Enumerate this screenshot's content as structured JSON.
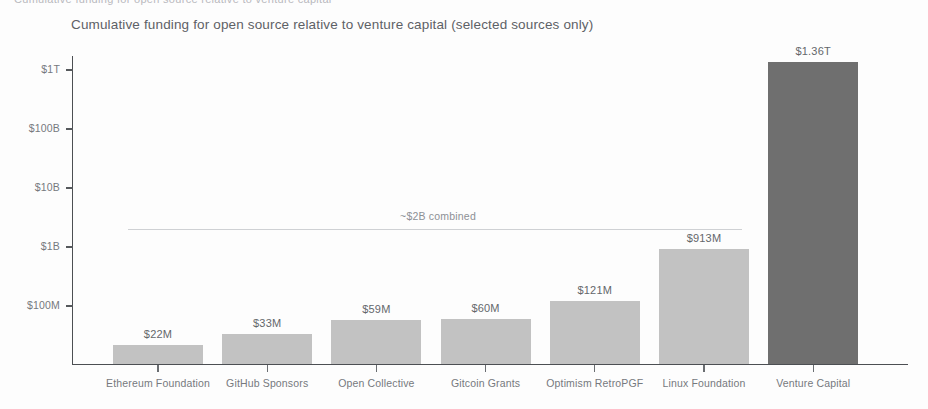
{
  "chart_data": {
    "type": "bar",
    "title": "Cumulative funding for open source relative to venture capital (selected sources only)",
    "xlabel": "",
    "ylabel": "",
    "yscale": "log",
    "ylim": [
      "10M",
      "3T"
    ],
    "grid": false,
    "legend": "none",
    "categories": [
      "Ethereum Foundation",
      "GitHub Sponsors",
      "Open Collective",
      "Gitcoin Grants",
      "Optimism RetroPGF",
      "Linux Foundation",
      "Venture Capital"
    ],
    "values": [
      22000000,
      33000000,
      59000000,
      60000000,
      121000000,
      913000000,
      1360000000000
    ],
    "value_labels": [
      "$22M",
      "$33M",
      "$59M",
      "$60M",
      "$121M",
      "$913M",
      "$1.36T"
    ],
    "ytick_labels": [
      "$100M",
      "$1B",
      "$10B",
      "$100B",
      "$1T"
    ],
    "ytick_values": [
      100000000,
      1000000000,
      10000000000,
      100000000000,
      1000000000000
    ],
    "annotations": [
      {
        "text": "~$2B combined",
        "value": 2000000000,
        "spans_categories": [
          "Ethereum Foundation",
          "GitHub Sponsors",
          "Open Collective",
          "Gitcoin Grants",
          "Optimism RetroPGF",
          "Linux Foundation"
        ]
      }
    ],
    "colors": {
      "bar_default": "#c2c2c2",
      "bar_highlight": "#6f6f6f",
      "axis": "#4c4f53",
      "text": "#76797e",
      "title_text": "#5d6166",
      "annotation_line": "#cfd1d4"
    },
    "highlight_category": "Venture Capital"
  },
  "scan": {
    "top_artifact": "Cumulative funding for open source relative to venture capital"
  }
}
